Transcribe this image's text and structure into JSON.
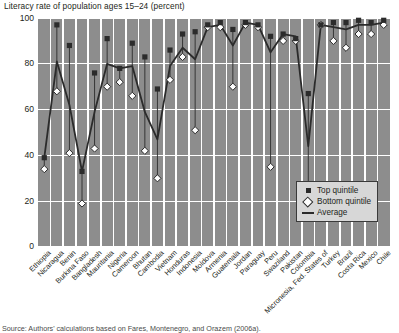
{
  "chart_data": {
    "type": "line",
    "title": "Literacy rate of population ages 15–24 (percent)",
    "xlabel": "",
    "ylabel": "",
    "ylim": [
      0,
      100
    ],
    "yticks": [
      0,
      20,
      40,
      60,
      80,
      100
    ],
    "grid": true,
    "legend_position": "bottom-right",
    "categories": [
      "Ethiopia",
      "Nicaragua",
      "Benin",
      "Burkina Faso",
      "Bangladesh",
      "Mauritania",
      "Nigeria",
      "Cameroon",
      "Bhutan",
      "Cambodia",
      "Vietnam",
      "Honduras",
      "Indonesia",
      "Moldova",
      "Armenia",
      "Guatemala",
      "Jordan",
      "Paraguay",
      "Peru",
      "Swaziland",
      "Pakistan",
      "Colombia",
      "Micronesia, Fed. States of",
      "Turkey",
      "Brazil",
      "Costa Rica",
      "Mexico",
      "Chile"
    ],
    "series": [
      {
        "name": "Top quintile",
        "marker": "square",
        "color": "#2b2b2b",
        "values": [
          39,
          97,
          88,
          33,
          76,
          91,
          78,
          89,
          83,
          69,
          86,
          93,
          94,
          97,
          98,
          95,
          98,
          97,
          92,
          93,
          91,
          67,
          97,
          98,
          98,
          99,
          98,
          99
        ]
      },
      {
        "name": "Bottom quintile",
        "marker": "diamond",
        "color": "#ffffff",
        "values": [
          34,
          68,
          41,
          19,
          43,
          70,
          72,
          66,
          42,
          30,
          73,
          83,
          51,
          96,
          96,
          70,
          97,
          96,
          35,
          90,
          90,
          26,
          97,
          90,
          87,
          93,
          93,
          97
        ]
      },
      {
        "name": "Average",
        "marker": "line",
        "color": "#2b2b2b",
        "values": [
          39,
          81,
          62,
          33,
          59,
          80,
          78,
          79,
          59,
          47,
          79,
          87,
          82,
          96,
          97,
          88,
          98,
          97,
          85,
          93,
          92,
          44,
          97,
          96,
          95,
          97,
          97,
          98
        ]
      }
    ],
    "legend": [
      "Top quintile",
      "Bottom quintile",
      "Average"
    ]
  },
  "source": "Source: Authors' calculations based on Fares, Montenegro, and Orazem (2006a)."
}
